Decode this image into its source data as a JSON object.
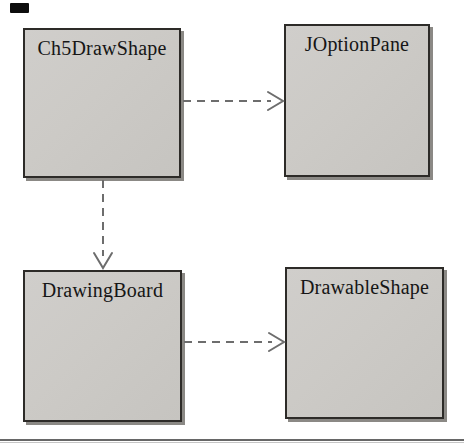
{
  "diagram": {
    "type": "uml-class-dependency-diagram",
    "classes": [
      {
        "id": "ch5drawshape",
        "label": "Ch5DrawShape"
      },
      {
        "id": "joptionpane",
        "label": "JOptionPane"
      },
      {
        "id": "drawingboard",
        "label": "DrawingBoard"
      },
      {
        "id": "drawableshape",
        "label": "DrawableShape"
      }
    ],
    "relationships": [
      {
        "from": "Ch5DrawShape",
        "to": "JOptionPane",
        "style": "dashed",
        "arrowhead": "open",
        "direction": "right"
      },
      {
        "from": "Ch5DrawShape",
        "to": "DrawingBoard",
        "style": "dashed",
        "arrowhead": "open",
        "direction": "down"
      },
      {
        "from": "DrawingBoard",
        "to": "DrawableShape",
        "style": "dashed",
        "arrowhead": "open",
        "direction": "right"
      }
    ]
  },
  "colors": {
    "background": "#ffffff",
    "box_fill": "#cccac6",
    "box_border": "#2d2b28",
    "box_shadow": "#8b8985",
    "label_text": "#161616",
    "arrow": "#6d6d6d",
    "bottom_rule": "#676767",
    "corner_mark": "#0d0d0d"
  }
}
